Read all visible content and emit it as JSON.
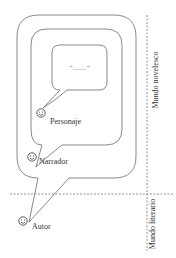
{
  "diagram": {
    "title": "",
    "characters": [
      {
        "id": "personaje",
        "label": "Personaje"
      },
      {
        "id": "narrador",
        "label": "Narrador"
      },
      {
        "id": "autor",
        "label": "Autor"
      }
    ],
    "speech_content": "“.......”",
    "regions": {
      "novelistic_world": "Mundo novelesco",
      "literary_world": "Mundo literario"
    },
    "colors": {
      "stroke": "#6a6a6a",
      "text": "#333333",
      "background": "#ffffff"
    }
  }
}
